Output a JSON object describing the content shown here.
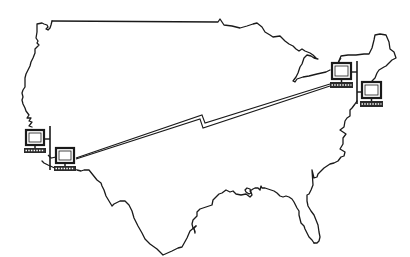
{
  "diagram": {
    "title": "",
    "colors": {
      "background": "#ffffff",
      "stroke": "#1a1a1a",
      "screen": "#ffffff",
      "keyboard": "#2a2a2a"
    },
    "map": {
      "name": "us-outline"
    },
    "nodes": [
      {
        "id": "west-pc-1",
        "region": "West Coast",
        "icon": "computer-icon"
      },
      {
        "id": "west-pc-2",
        "region": "West Coast",
        "icon": "computer-icon"
      },
      {
        "id": "east-pc-1",
        "region": "Northeast",
        "icon": "computer-icon"
      },
      {
        "id": "east-pc-2",
        "region": "Northeast",
        "icon": "computer-icon"
      }
    ],
    "links": [
      {
        "from": "west-pc-1",
        "to": "west-pc-2",
        "type": "lan-bus"
      },
      {
        "from": "east-pc-1",
        "to": "east-pc-2",
        "type": "lan-bus"
      },
      {
        "from": "west-pc-2",
        "to": "east-pc-1",
        "type": "wan-lightning-link"
      }
    ],
    "labels": []
  }
}
